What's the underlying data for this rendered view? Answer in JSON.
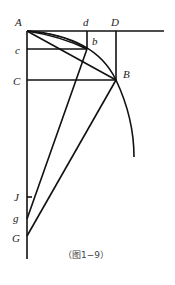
{
  "figure": {
    "caption": "（图1−9）",
    "points": {
      "A": "A",
      "d": "d",
      "D": "D",
      "b": "b",
      "c": "c",
      "C": "C",
      "B": "B",
      "J": "J",
      "g": "g",
      "G": "G"
    }
  }
}
